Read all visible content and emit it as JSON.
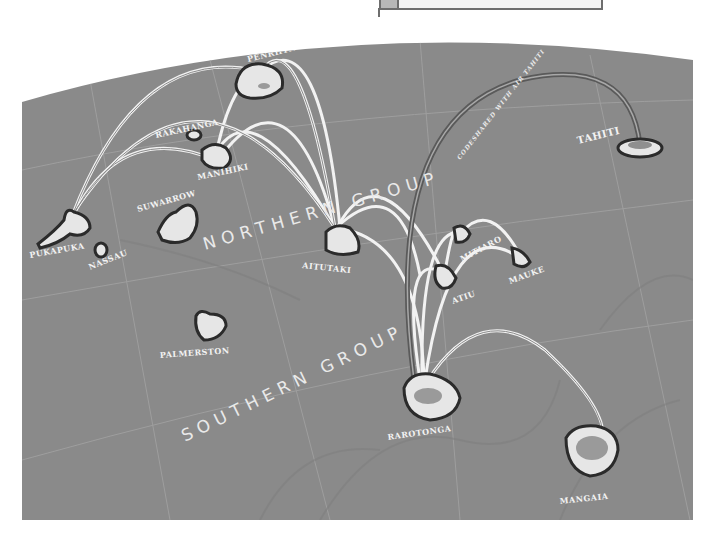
{
  "map": {
    "background_color": "#8a8a8a",
    "island_fill": "#e6e6e6",
    "island_outline": "#2b2b2b",
    "route_color": "#f0f0f0",
    "groups": {
      "northern": "NORTHERN GROUP",
      "southern": "SOUTHERN GROUP"
    },
    "islands": {
      "tongareva": "TONGAREVA/",
      "penrhyn": "PENRHYN",
      "rakahanga": "RAKAHANGA",
      "manihiki": "MANIHIKI",
      "pukapuka": "PUKAPUKA",
      "nassau": "NASSAU",
      "suwarrow": "SUWARROW",
      "aitutaki": "AITUTAKI",
      "palmerston": "PALMERSTON",
      "mitiaro": "MITIARO",
      "mauke": "MAUKE",
      "atiu": "ATIU",
      "rarotonga": "RAROTONGA",
      "mangaia": "MANGAIA",
      "tahiti": "TAHITI"
    },
    "annotations": {
      "codeshare": "CODESHARED WITH AIR TAHITI"
    }
  }
}
